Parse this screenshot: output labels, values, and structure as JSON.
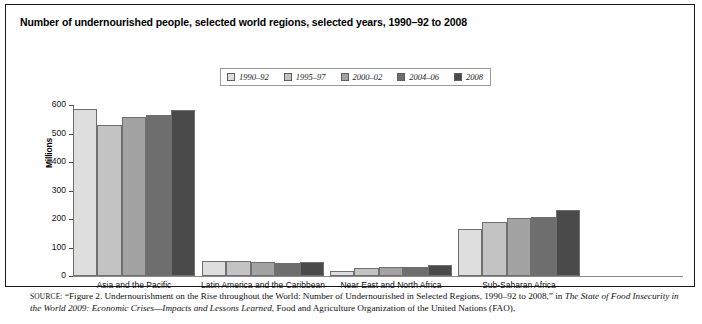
{
  "figure": {
    "title": "Number of undernourished people, selected world regions, selected years, 1990–92 to 2008",
    "source_prefix": "SOURCE:",
    "source_part1": " “Figure 2. Undernourishment on the Rise throughout the World: Number of Undernourished in Selected Regions, 1990–92 to 2008,” in ",
    "source_italic1": "The State of Food Insecurity in the World 2009: Economic Crises—Impacts and Lessons Learned",
    "source_part2": ", Food and Agriculture Organization of the United Nations (FAO),"
  },
  "chart_data": {
    "type": "bar",
    "title": "Number of undernourished people, selected world regions, selected years, 1990–92 to 2008",
    "xlabel": "",
    "ylabel": "Millions",
    "ylim": [
      0,
      600
    ],
    "yticks": [
      0,
      100,
      200,
      300,
      400,
      500,
      600
    ],
    "grid": false,
    "legend_position": "top-center",
    "categories": [
      "Asia and the Pacific",
      "Latin America and the Caribbean",
      "Near East and North Africa",
      "Sub-Saharan Africa"
    ],
    "series": [
      {
        "name": "1990–92",
        "color": "#dedede",
        "values": [
          587,
          54,
          19,
          166
        ]
      },
      {
        "name": "1995–97",
        "color": "#c3c3c3",
        "values": [
          530,
          53,
          28,
          190
        ]
      },
      {
        "name": "2000–02",
        "color": "#a3a3a3",
        "values": [
          557,
          50,
          30,
          203
        ]
      },
      {
        "name": "2004–06",
        "color": "#6e6e6e",
        "values": [
          565,
          47,
          31,
          208
        ]
      },
      {
        "name": "2008",
        "color": "#4a4a4a",
        "values": [
          583,
          49,
          37,
          232
        ]
      }
    ]
  }
}
